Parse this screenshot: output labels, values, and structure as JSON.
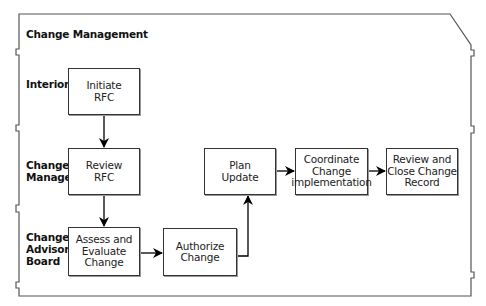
{
  "diagram": {
    "title": "Change Management",
    "lanes": [
      {
        "label_1": "Interior",
        "label_2": "",
        "label_3": ""
      },
      {
        "label_1": "Change",
        "label_2": "Manager",
        "label_3": ""
      },
      {
        "label_1": "Change",
        "label_2": "Advisory",
        "label_3": "Board"
      }
    ],
    "steps": [
      {
        "line_1": "Initiate",
        "line_2": "RFC",
        "line_3": ""
      },
      {
        "line_1": "Review",
        "line_2": "RFC",
        "line_3": ""
      },
      {
        "line_1": "Assess and",
        "line_2": "Evaluate",
        "line_3": "Change"
      },
      {
        "line_1": "Authorize",
        "line_2": "Change",
        "line_3": ""
      },
      {
        "line_1": "Plan",
        "line_2": "Update",
        "line_3": ""
      },
      {
        "line_1": "Coordinate",
        "line_2": "Change",
        "line_3": "implementation"
      },
      {
        "line_1": "Review and",
        "line_2": "Close Change",
        "line_3": "Record"
      }
    ],
    "flow": [
      [
        "Initiate RFC",
        "Review RFC"
      ],
      [
        "Review RFC",
        "Assess and Evaluate Change"
      ],
      [
        "Assess and Evaluate Change",
        "Authorize Change"
      ],
      [
        "Authorize Change",
        "Plan Update"
      ],
      [
        "Plan Update",
        "Coordinate Change implementation"
      ],
      [
        "Coordinate Change implementation",
        "Review and Close Change Record"
      ]
    ]
  }
}
